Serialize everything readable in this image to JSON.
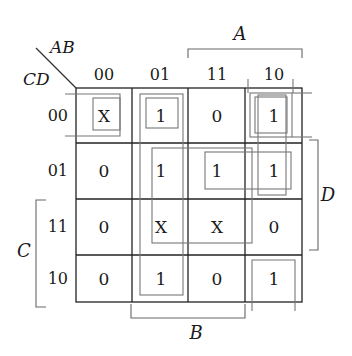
{
  "kmap": {
    "row_var_label": "CD",
    "col_var_label": "AB",
    "col_headers": [
      "00",
      "01",
      "11",
      "10"
    ],
    "row_headers": [
      "00",
      "01",
      "11",
      "10"
    ],
    "cells": [
      [
        "X",
        "1",
        "0",
        "1"
      ],
      [
        "0",
        "1",
        "1",
        "1"
      ],
      [
        "0",
        "X",
        "X",
        "0"
      ],
      [
        "0",
        "1",
        "0",
        "1"
      ]
    ],
    "brackets": {
      "top": "A",
      "right": "D",
      "left": "C",
      "bottom": "B"
    }
  },
  "colors": {
    "grid": "#222222",
    "group_outline": "#777777",
    "bracket": "#666666"
  }
}
